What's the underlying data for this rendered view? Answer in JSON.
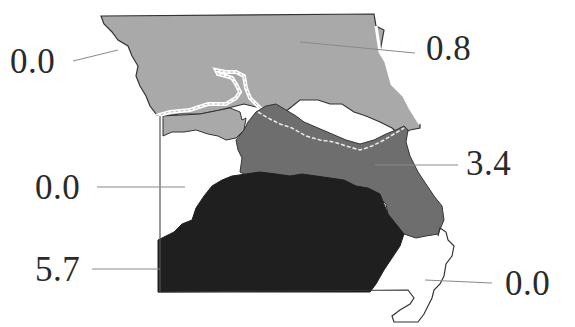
{
  "map": {
    "subject": "Missouri regions",
    "colors": {
      "background": "#ffffff",
      "outline": "#333333",
      "leader_line": "#8a8a8a",
      "region_light": "#a9a9a9",
      "region_medium": "#6e6e6e",
      "region_dark": "#1f1f1f",
      "region_empty": "#ffffff",
      "label_text": "#2a2a2a"
    },
    "regions": [
      {
        "id": "northwest-river",
        "value": "0.0",
        "shade": "empty"
      },
      {
        "id": "north",
        "value": "0.8",
        "shade": "light"
      },
      {
        "id": "east-central",
        "value": "3.4",
        "shade": "medium"
      },
      {
        "id": "west-central",
        "value": "0.0",
        "shade": "empty"
      },
      {
        "id": "south",
        "value": "5.7",
        "shade": "dark"
      },
      {
        "id": "southeast-bootheel",
        "value": "0.0",
        "shade": "empty"
      }
    ]
  },
  "labels": {
    "northwest": "0.0",
    "north": "0.8",
    "east_central": "3.4",
    "west_central": "0.0",
    "south": "5.7",
    "southeast": "0.0"
  }
}
